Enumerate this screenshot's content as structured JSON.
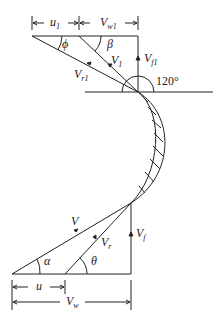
{
  "diagram": {
    "outlet_triangle": {
      "labels": {
        "u1": {
          "main": "u",
          "sub": "1"
        },
        "Vw1": {
          "main": "V",
          "sub": "w1"
        },
        "phi": "ϕ",
        "beta": "β",
        "V1": {
          "main": "V",
          "sub": "1"
        },
        "Vf1": {
          "main": "V",
          "sub": "f1"
        },
        "Vr1": {
          "main": "V",
          "sub": "r1"
        },
        "angle": "120°"
      }
    },
    "inlet_triangle": {
      "labels": {
        "V": "V",
        "Vr": {
          "main": "V",
          "sub": "r"
        },
        "Vf": {
          "main": "V",
          "sub": "f"
        },
        "alpha": "α",
        "theta": "θ",
        "u": "u",
        "Vw": {
          "main": "V",
          "sub": "w"
        }
      }
    },
    "colors": {
      "stroke": "#222222",
      "background": "#ffffff"
    }
  }
}
